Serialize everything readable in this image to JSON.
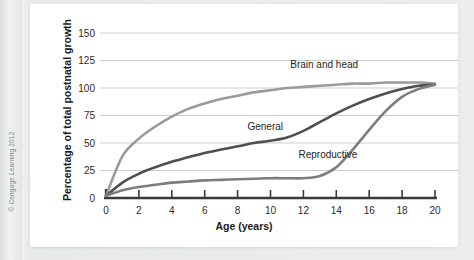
{
  "figure": {
    "credit": "© Cengage Learning 2012",
    "panel_background": "#ffffff",
    "page_background": "#e9eaea"
  },
  "chart_data": {
    "type": "line",
    "title": "",
    "xlabel": "Age (years)",
    "ylabel": "Percentage of total postnatal growth",
    "xlim": [
      0,
      20
    ],
    "ylim": [
      0,
      150
    ],
    "xticks": [
      0,
      2,
      4,
      6,
      8,
      10,
      12,
      14,
      16,
      18,
      20
    ],
    "xtick_labels": [
      "0",
      "2",
      "4",
      "6",
      "8",
      "10",
      "12",
      "14",
      "16",
      "18",
      "20"
    ],
    "yticks": [
      0,
      25,
      50,
      75,
      100,
      125,
      150
    ],
    "ytick_labels": [
      "0",
      "25",
      "50",
      "75",
      "100",
      "125",
      "150"
    ],
    "grid": true,
    "grid_axis": "y",
    "grid_color": "#cdcdcd",
    "legend": "inline-annotations",
    "legend_position": "on-plot",
    "x": [
      0,
      1,
      2,
      3,
      4,
      5,
      6,
      7,
      8,
      9,
      10,
      11,
      12,
      13,
      14,
      15,
      16,
      17,
      18,
      19,
      20
    ],
    "series": [
      {
        "name": "Brain and head",
        "color": "#9a9a9a",
        "label_x": 11.2,
        "label_y": 118,
        "values": [
          2,
          38,
          54,
          65,
          74,
          81,
          86,
          90,
          93,
          96,
          98,
          100,
          101,
          102,
          103,
          104,
          104,
          105,
          105,
          105,
          104
        ]
      },
      {
        "name": "General",
        "color": "#4f4f4f",
        "label_x": 8.6,
        "label_y": 62,
        "values": [
          2,
          14,
          22,
          28,
          33,
          37,
          41,
          44,
          47,
          50,
          52,
          55,
          61,
          69,
          77,
          84,
          90,
          95,
          99,
          102,
          103
        ]
      },
      {
        "name": "Reproductive",
        "color": "#7d7d7d",
        "label_x": 11.7,
        "label_y": 36,
        "values": [
          2,
          7,
          10,
          12,
          14,
          15,
          16,
          16.5,
          17,
          17.5,
          18,
          18,
          18,
          20,
          28,
          44,
          62,
          79,
          92,
          99,
          103
        ]
      }
    ]
  }
}
